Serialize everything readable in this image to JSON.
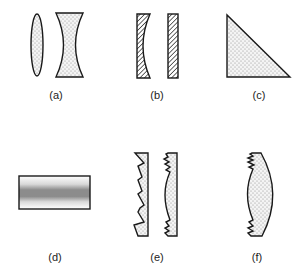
{
  "figure": {
    "panels": [
      {
        "id": "a",
        "label": "(a)",
        "description": "Biconvex lens and biconcave lens",
        "fill": "stipple"
      },
      {
        "id": "b",
        "label": "(b)",
        "description": "Plano-concave element and plane-parallel plate",
        "fill": "hatch"
      },
      {
        "id": "c",
        "label": "(c)",
        "description": "Right-angle prism",
        "fill": "stipple"
      },
      {
        "id": "d",
        "label": "(d)",
        "description": "Gradient-index plate with gray band",
        "fill": "gradient"
      },
      {
        "id": "e",
        "label": "(e)",
        "description": "Fresnel lenses (linear and curved)",
        "fill": "stipple"
      },
      {
        "id": "f",
        "label": "(f)",
        "description": "Hybrid refractive/diffractive lens",
        "fill": "stipple"
      }
    ],
    "colors": {
      "outline": "#1a1a1a",
      "stipple_bg": "#f4f4f4",
      "stipple_dot": "#8a8a8a",
      "band_dark": "#8c8c8c",
      "background": "#ffffff"
    }
  }
}
